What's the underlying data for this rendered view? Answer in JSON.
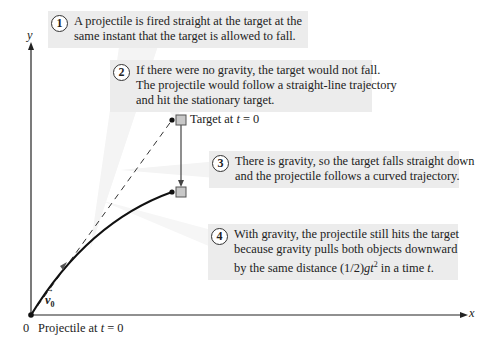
{
  "figure": {
    "axes": {
      "y_label": "y",
      "x_label": "x",
      "origin_label": "0"
    },
    "labels": {
      "target_t0_prefix": "Target at ",
      "target_t0_var": "t",
      "target_t0_suffix": " = 0",
      "projectile_t0_prefix": "Projectile at ",
      "projectile_t0_var": "t",
      "projectile_t0_suffix": " = 0",
      "velocity": "v",
      "velocity_sub": "0"
    },
    "callouts": [
      {
        "number": "1",
        "lines": [
          "A projectile is fired straight at the target at the",
          "same instant that the target is allowed to fall."
        ]
      },
      {
        "number": "2",
        "lines": [
          "If there were no gravity, the target would not fall.",
          "The projectile would follow a straight-line trajectory",
          "and hit the stationary target."
        ]
      },
      {
        "number": "3",
        "lines": [
          "There is gravity, so the target falls straight down",
          "and the projectile follows a curved trajectory."
        ]
      },
      {
        "number": "4",
        "lines": [
          "With gravity, the projectile still hits the target",
          "because gravity pulls both objects downward"
        ],
        "last_line_prefix": "by the same distance (1/2)",
        "last_line_g": "g",
        "last_line_t": "t",
        "last_line_exp": "2",
        "last_line_mid": " in a time ",
        "last_line_tvar": "t",
        "last_line_end": "."
      }
    ],
    "colors": {
      "callout_bg": "#ececec",
      "target_fill": "#c8c8c8",
      "line": "#222222"
    }
  }
}
